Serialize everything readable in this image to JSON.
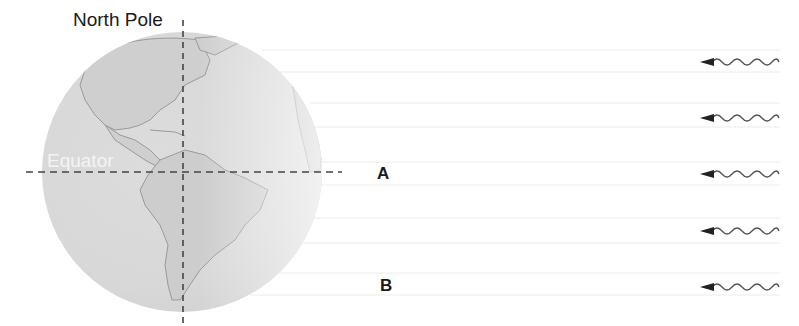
{
  "diagram": {
    "type": "earth-sunlight-diagram",
    "labels": {
      "north_pole": "North Pole",
      "equator": "Equator",
      "point_a": "A",
      "point_b": "B"
    },
    "sun_rays": {
      "count": 5,
      "direction": "right-to-left",
      "y_positions": [
        62,
        118,
        174,
        231,
        287
      ]
    },
    "colors": {
      "globe_fill": "#d6d6d6",
      "land_fill": "#c4c4c4",
      "coastline": "#9a9a9a",
      "dashed_lines": "#444444",
      "ray_arrow": "#333333",
      "light_band": "#eeeeee"
    }
  }
}
